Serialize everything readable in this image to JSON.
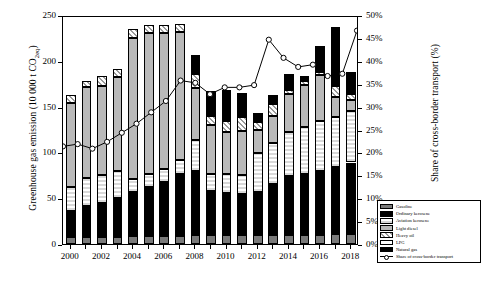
{
  "chart_data": {
    "type": "bar",
    "title": "",
    "xlabel": "",
    "ylabel": "Greenhouse gas emission (10 000 t CO2eq)",
    "ylabel_right": "Share of cross-border transport (%)",
    "ylim": [
      0,
      250
    ],
    "yticks": [
      0,
      50,
      100,
      150,
      200,
      250
    ],
    "ylim_right": [
      0,
      50
    ],
    "yticks_right": [
      "0%",
      "5%",
      "10%",
      "15%",
      "20%",
      "25%",
      "30%",
      "35%",
      "40%",
      "45%",
      "50%"
    ],
    "grid": false,
    "legend_position": "bottom-right",
    "categories": [
      2000,
      2001,
      2002,
      2003,
      2004,
      2005,
      2006,
      2007,
      2008,
      2009,
      2010,
      2011,
      2012,
      2013,
      2014,
      2015,
      2016,
      2017,
      2018
    ],
    "xtick_labels": [
      "2000",
      "2002",
      "2004",
      "2006",
      "2008",
      "2010",
      "2012",
      "2014",
      "2016",
      "2018"
    ],
    "series": [
      {
        "name": "Gasoline",
        "pattern": "solid-dark-gray",
        "color": "#7a7a7a",
        "values": [
          8,
          8,
          8,
          8,
          9,
          9,
          9,
          9,
          10,
          10,
          10,
          10,
          10,
          10,
          10,
          10,
          10,
          11,
          11
        ]
      },
      {
        "name": "Ordinary kerosene",
        "pattern": "solid-black",
        "color": "#000000",
        "values": [
          28,
          34,
          37,
          42,
          48,
          53,
          59,
          67,
          70,
          48,
          46,
          45,
          47,
          56,
          64,
          66,
          70,
          73,
          78
        ]
      },
      {
        "name": "Aviation kerosene",
        "pattern": "checker",
        "color": "#d8d8d8",
        "values": [
          26,
          30,
          30,
          30,
          14,
          14,
          14,
          16,
          34,
          18,
          20,
          20,
          42,
          44,
          48,
          52,
          54,
          55,
          56
        ]
      },
      {
        "name": "Light diesel",
        "pattern": "solid-light-gray",
        "color": "#b9b9b9",
        "values": [
          92,
          99,
          98,
          102,
          154,
          154,
          148,
          139,
          56,
          54,
          46,
          48,
          26,
          30,
          42,
          46,
          50,
          22,
          12
        ]
      },
      {
        "name": "Heavy oil",
        "pattern": "diagonal-hatch",
        "color": "#ffffff",
        "values": [
          9,
          7,
          10,
          9,
          10,
          9,
          9,
          9,
          16,
          10,
          12,
          16,
          8,
          13,
          4,
          4,
          4,
          12,
          7
        ]
      },
      {
        "name": "LPG",
        "pattern": "solid-white",
        "color": "#ffffff",
        "values": [
          0,
          0,
          0,
          0,
          0,
          0,
          0,
          0,
          0,
          0,
          0,
          0,
          0,
          0,
          0,
          0,
          0,
          0,
          0
        ]
      },
      {
        "name": "Natural gas",
        "pattern": "solid-black",
        "color": "#000000",
        "values": [
          0,
          0,
          0,
          0,
          0,
          0,
          0,
          0,
          20,
          27,
          34,
          26,
          10,
          10,
          18,
          5,
          28,
          64,
          24
        ]
      }
    ],
    "line_series": {
      "name": "Share of cross-border transport",
      "marker": "open-circle",
      "values": [
        21.5,
        22.0,
        21.0,
        22.5,
        24.5,
        26.5,
        29.0,
        31.5,
        36.0,
        35.5,
        33.0,
        34.5,
        34.5,
        35.0,
        45.0,
        41.0,
        39.0,
        39.5,
        37.0,
        37.5,
        47.0
      ]
    },
    "legend_entries": [
      "Gasoline",
      "Ordinary kerosene",
      "Aviation kerosene",
      "Light diesel",
      "Heavy oil",
      "LPG",
      "Natural gas",
      "Share of cross-border transport"
    ]
  }
}
